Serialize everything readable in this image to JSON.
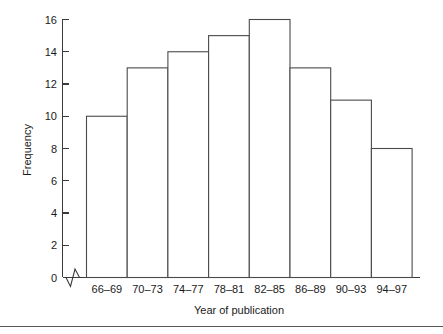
{
  "chart_data": {
    "type": "bar",
    "title": "",
    "subtitle": "",
    "xlabel": "Year of publication",
    "ylabel": "Frequency",
    "categories": [
      "66–69",
      "70–73",
      "74–77",
      "78–81",
      "82–85",
      "86–89",
      "90–93",
      "94–97"
    ],
    "values": [
      10,
      13,
      14,
      15,
      16,
      13,
      11,
      8
    ],
    "ylim": [
      0,
      16
    ],
    "yticks": [
      0,
      2,
      4,
      6,
      8,
      10,
      12,
      14,
      16
    ],
    "ytick_labels": [
      "0",
      "2",
      "4",
      "6",
      "8",
      "10",
      "12",
      "14",
      "16"
    ],
    "grid": false,
    "legend": false,
    "legend_position": "none",
    "bar_style": "contiguous-outlined",
    "axis_break": "x-axis zigzag between origin and first bin",
    "annotations": []
  },
  "style": {
    "background": "#ffffff",
    "axis_color": "#3a3a3a",
    "bar_stroke": "#4a4a4a",
    "bar_fill": "#ffffff",
    "text_color": "#1a1a1a",
    "footer_rule_color": "#585858"
  }
}
